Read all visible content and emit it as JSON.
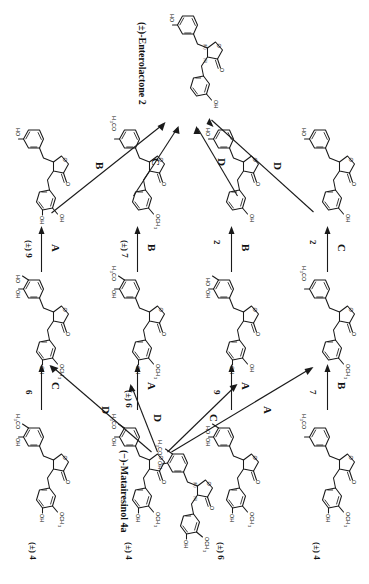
{
  "scheme": {
    "type": "chemical-reaction-scheme",
    "orientation_deg": 90,
    "target": {
      "name": "(±)-Enterolactone 2",
      "id": "2",
      "role": "final-product"
    },
    "start": {
      "name": "(−)-Matairesinol 4a",
      "id": "4a",
      "role": "starting-material"
    },
    "step_legend": [
      "A",
      "B",
      "C",
      "D"
    ],
    "rows": [
      {
        "row": 1,
        "compounds": [
          {
            "label": "(±) 4",
            "column": 1
          },
          {
            "label": "(±) 8",
            "column": 2
          },
          {
            "label": "(±) 9",
            "column": 3
          }
        ],
        "arrows_between": [
          "C",
          "A"
        ]
      },
      {
        "row": 2,
        "compounds": [
          {
            "label": "(±) 4",
            "column": 1
          },
          {
            "label": "(±) 6",
            "column": 2
          },
          {
            "label": "(±) 7",
            "column": 3
          }
        ],
        "arrows_between": [
          "D",
          "B"
        ]
      },
      {
        "row": 3,
        "compounds": [
          {
            "label": "8",
            "column": 1
          },
          {
            "label": "9",
            "column": 2
          },
          {
            "label": "2",
            "column": 3
          }
        ],
        "arrows_between": [
          "A",
          "B"
        ]
      },
      {
        "row": 4,
        "compounds": [
          {
            "label": "6",
            "column": 1
          },
          {
            "label": "7",
            "column": 2
          },
          {
            "label": "2",
            "column": 3
          }
        ],
        "arrows_between": [
          "C",
          "B"
        ]
      }
    ],
    "fan_out_from_start": [
      {
        "step": "A",
        "to_row": 1
      },
      {
        "step": "C",
        "to_row": 2
      },
      {
        "step": "D",
        "to_row": 3
      },
      {
        "step": "D",
        "to_row": 4
      }
    ],
    "fan_in_to_target": [
      {
        "step": "B",
        "from_row": 1
      },
      {
        "step": "C",
        "from_row": 2
      },
      {
        "step": "D",
        "from_row": 3
      },
      {
        "step": "D",
        "from_row": 4
      }
    ],
    "step_labels": {
      "top_1": "D",
      "top_2": "D",
      "top_3": "C",
      "top_4": "B",
      "mid_r1": "C",
      "mid_r2": "B",
      "mid_r3": "B",
      "mid_r4": "A",
      "mid2_r1": "B",
      "mid2_r2": "A",
      "mid2_r3": "A",
      "mid2_r4": "C",
      "bot_1": "A",
      "bot_2": "C",
      "bot_3": "D",
      "bot_4": "D"
    },
    "compound_labels": {
      "c_r1_left": "(±) 4",
      "c_r1_mid": "(±) 6",
      "c_r1_right": "(±) 7",
      "c_r2_left": "8",
      "c_r2_mid": "9",
      "c_r2_right": "2",
      "c_r3_left": "6",
      "c_r3_mid": "7",
      "c_r3_right": "2",
      "c_r4_left": "(±) 4",
      "c_r4_mid": "(±) 8",
      "c_r4_right": "(±) 9"
    },
    "atoms": {
      "oh": "OH",
      "ho": "HO",
      "o": "O",
      "och3": "OCH",
      "h3co": "H",
      "three": "3",
      "co": "CO",
      "r": "(R)",
      "s": "(S)"
    }
  }
}
